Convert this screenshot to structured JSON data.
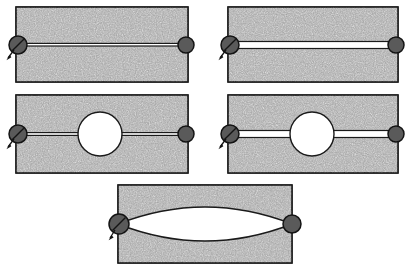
{
  "figure": {
    "canvas": {
      "width": 413,
      "height": 272,
      "background": "#ffffff"
    },
    "style": {
      "plate_fill_color": "#a0a0a0",
      "plate_texture": "speckled-noise",
      "outline_color": "#1a1a1a",
      "cavity_fill_color": "#ffffff",
      "pin_fill_color": "#5a5a5a",
      "pin_outline_color": "#141414"
    },
    "panels": [
      {
        "id": "panel-top-left",
        "name": "center-crack-thin",
        "label": "",
        "plate": {
          "x": 16,
          "y": 7,
          "width": 172,
          "height": 75
        },
        "feature": "thin-horizontal-crack",
        "cavity": "none",
        "crack_thickness": 2,
        "crack_y": 45,
        "pins": [
          {
            "side": "left",
            "cx": 16,
            "cy": 45,
            "r": 9,
            "slashed": true,
            "arrow": true
          },
          {
            "side": "right",
            "cx": 186,
            "cy": 45,
            "r": 8,
            "slashed": false,
            "arrow": false
          }
        ]
      },
      {
        "id": "panel-top-right",
        "name": "center-slit-thick",
        "label": "",
        "plate": {
          "x": 228,
          "y": 7,
          "width": 170,
          "height": 75
        },
        "feature": "thick-horizontal-slit",
        "cavity": "none",
        "crack_thickness": 7,
        "crack_y": 45,
        "pins": [
          {
            "side": "left",
            "cx": 228,
            "cy": 45,
            "r": 9,
            "slashed": true,
            "arrow": true
          },
          {
            "side": "right",
            "cx": 396,
            "cy": 45,
            "r": 8,
            "slashed": false,
            "arrow": false
          }
        ]
      },
      {
        "id": "panel-mid-left",
        "name": "circular-hole-with-thin-cracks",
        "label": "",
        "plate": {
          "x": 16,
          "y": 95,
          "width": 172,
          "height": 78
        },
        "feature": "thin-horizontal-crack",
        "cavity": "circle",
        "cavity_cx": 100,
        "cavity_cy": 134,
        "cavity_r": 22,
        "crack_thickness": 2,
        "crack_y": 134,
        "pins": [
          {
            "side": "left",
            "cx": 16,
            "cy": 134,
            "r": 9,
            "slashed": true,
            "arrow": true
          },
          {
            "side": "right",
            "cx": 186,
            "cy": 134,
            "r": 8,
            "slashed": false,
            "arrow": false
          }
        ]
      },
      {
        "id": "panel-mid-right",
        "name": "circular-hole-with-thick-slits",
        "label": "",
        "plate": {
          "x": 228,
          "y": 95,
          "width": 170,
          "height": 78
        },
        "feature": "thick-horizontal-slit",
        "cavity": "circle",
        "cavity_cx": 312,
        "cavity_cy": 134,
        "cavity_r": 22,
        "crack_thickness": 7,
        "crack_y": 134,
        "pins": [
          {
            "side": "left",
            "cx": 228,
            "cy": 134,
            "r": 9,
            "slashed": true,
            "arrow": true
          },
          {
            "side": "right",
            "cx": 396,
            "cy": 134,
            "r": 8,
            "slashed": false,
            "arrow": false
          }
        ]
      },
      {
        "id": "panel-bottom",
        "name": "lenticular-elliptical-cavity",
        "label": "",
        "plate": {
          "x": 118,
          "y": 185,
          "width": 174,
          "height": 78
        },
        "feature": "lens-shaped-cavity",
        "cavity": "lens",
        "cavity_cx": 205,
        "cavity_cy": 224,
        "cavity_rx": 87,
        "cavity_ry": 28,
        "pins": [
          {
            "side": "left",
            "cx": 118,
            "cy": 224,
            "r": 10,
            "slashed": true,
            "arrow": true
          },
          {
            "side": "right",
            "cx": 292,
            "cy": 224,
            "r": 9,
            "slashed": false,
            "arrow": false
          }
        ]
      }
    ],
    "annotations": {
      "load_arrow_direction": "down-left",
      "pin_marker_left": "fixed-support-pin",
      "pin_marker_right": "roller-pin"
    }
  }
}
